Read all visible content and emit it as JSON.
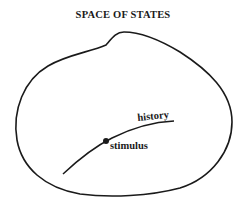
{
  "title": "SPACE OF STATES",
  "labels": {
    "history": "history",
    "stimulus": "stimulus"
  },
  "colors": {
    "stroke": "#1a1a1a",
    "background": "#ffffff"
  }
}
